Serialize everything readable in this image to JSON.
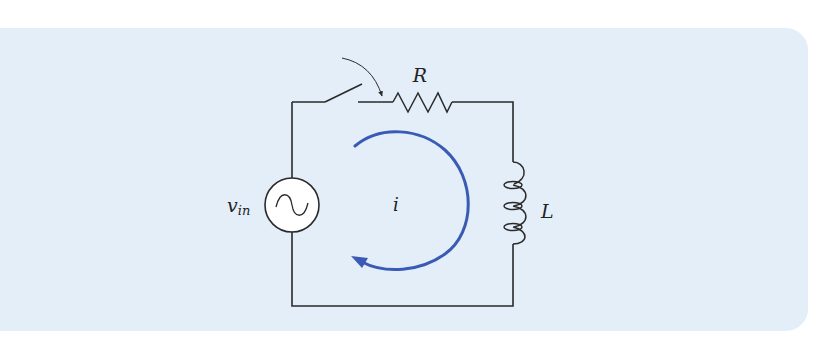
{
  "diagram": {
    "type": "RL series circuit with switch",
    "labels": {
      "resistor": "R",
      "inductor": "L",
      "source_main": "v",
      "source_sub": "in",
      "current": "i"
    },
    "colors": {
      "panel_bg": "#e3eef9",
      "wire": "#2a2a2a",
      "current_arrow": "#3a5bb5",
      "source_fill": "#ffffff"
    },
    "components": [
      {
        "name": "AC voltage source",
        "label": "v_in"
      },
      {
        "name": "switch",
        "state": "open, closing (curved arrow)"
      },
      {
        "name": "resistor",
        "label": "R"
      },
      {
        "name": "inductor",
        "label": "L"
      },
      {
        "name": "current loop arrow",
        "label": "i",
        "direction": "clockwise"
      }
    ]
  }
}
